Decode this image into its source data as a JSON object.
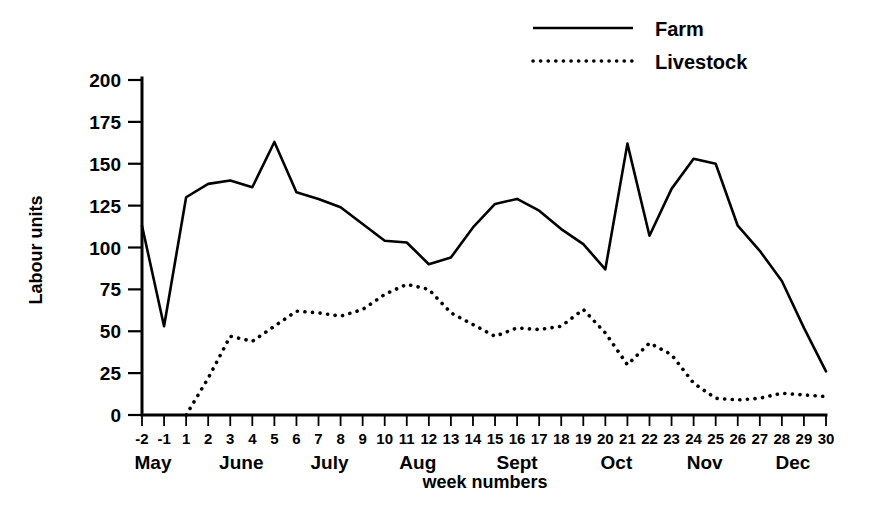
{
  "chart_data": {
    "type": "line",
    "title": "",
    "xlabel": "week numbers",
    "ylabel": "Labour units",
    "ylim": [
      0,
      200
    ],
    "grid": false,
    "legend_position": "top-right",
    "x": [
      "-2",
      "-1",
      "1",
      "2",
      "3",
      "4",
      "5",
      "6",
      "7",
      "8",
      "9",
      "10",
      "11",
      "12",
      "13",
      "14",
      "15",
      "16",
      "17",
      "18",
      "19",
      "20",
      "21",
      "22",
      "23",
      "24",
      "25",
      "26",
      "27",
      "28",
      "29",
      "30"
    ],
    "yticks": [
      0,
      25,
      50,
      75,
      100,
      125,
      150,
      175,
      200
    ],
    "month_groups": [
      {
        "label": "May",
        "start": "-2",
        "end": "-1"
      },
      {
        "label": "June",
        "start": "2",
        "end": "5"
      },
      {
        "label": "July",
        "start": "6",
        "end": "9"
      },
      {
        "label": "Aug",
        "start": "10",
        "end": "13"
      },
      {
        "label": "Sept",
        "start": "14",
        "end": "18"
      },
      {
        "label": "Oct",
        "start": "19",
        "end": "22"
      },
      {
        "label": "Nov",
        "start": "23",
        "end": "26"
      },
      {
        "label": "Dec",
        "start": "27",
        "end": "30"
      }
    ],
    "series": [
      {
        "name": "Farm",
        "style": "solid",
        "color": "#000000",
        "values": [
          113,
          53,
          130,
          138,
          140,
          136,
          163,
          133,
          129,
          124,
          114,
          104,
          103,
          90,
          94,
          112,
          126,
          129,
          122,
          111,
          102,
          87,
          162,
          107,
          135,
          153,
          150,
          113,
          98,
          80,
          52,
          26
        ]
      },
      {
        "name": "Livestock",
        "style": "dotted",
        "color": "#000000",
        "values": [
          null,
          null,
          0,
          22,
          47,
          44,
          53,
          62,
          61,
          59,
          63,
          72,
          78,
          75,
          61,
          54,
          47,
          52,
          51,
          53,
          63,
          49,
          30,
          43,
          36,
          19,
          10,
          9,
          10,
          13,
          12,
          11
        ]
      }
    ],
    "legend": [
      {
        "label": "Farm",
        "style": "solid"
      },
      {
        "label": "Livestock",
        "style": "dotted"
      }
    ]
  }
}
